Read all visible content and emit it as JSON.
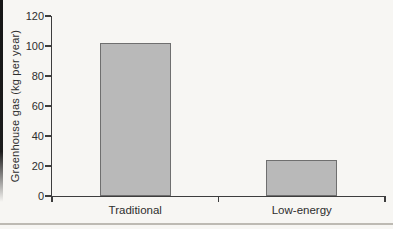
{
  "figure": {
    "background_color": "#f7f6f3",
    "page_edge_rule_color": "#1a1a1a",
    "divider_rule_color": "#bdbab3"
  },
  "chart_data": {
    "type": "bar",
    "title": "",
    "categories": [
      "Traditional",
      "Low-energy"
    ],
    "values": [
      102,
      24
    ],
    "xlabel": "",
    "ylabel": "Greenhouse gas (kg per year)",
    "ylim": [
      0,
      120
    ],
    "yticks": [
      0,
      20,
      40,
      60,
      80,
      100,
      120
    ],
    "grid": false,
    "legend": false,
    "bar_color": "#b9b9b9",
    "bar_border_color": "#6f6f6f",
    "axis_color": "#3d3d3d",
    "text_color": "#2e2e2e"
  }
}
